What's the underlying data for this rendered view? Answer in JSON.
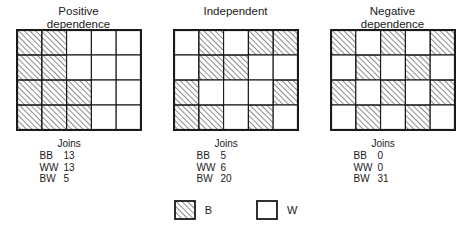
{
  "figure": {
    "panels": [
      {
        "id": "positive-dependence",
        "title": "Positive\ndependence",
        "grid": {
          "cols": 5,
          "rows": 4,
          "cells": [
            [
              "B",
              "B",
              "W",
              "W",
              "W"
            ],
            [
              "B",
              "B",
              "W",
              "W",
              "W"
            ],
            [
              "B",
              "B",
              "B",
              "W",
              "W"
            ],
            [
              "B",
              "B",
              "B",
              "W",
              "W"
            ]
          ]
        },
        "stats": {
          "heading": "Joins",
          "rows": [
            {
              "key": "BB",
              "value": "13"
            },
            {
              "key": "WW",
              "value": "13"
            },
            {
              "key": "BW",
              "value": "5"
            }
          ]
        }
      },
      {
        "id": "independent",
        "title": "Independent",
        "grid": {
          "cols": 5,
          "rows": 4,
          "cells": [
            [
              "W",
              "B",
              "W",
              "B",
              "B"
            ],
            [
              "W",
              "B",
              "B",
              "W",
              "W"
            ],
            [
              "B",
              "W",
              "W",
              "W",
              "B"
            ],
            [
              "B",
              "B",
              "W",
              "B",
              "W"
            ]
          ]
        },
        "stats": {
          "heading": "Joins",
          "rows": [
            {
              "key": "BB",
              "value": "5"
            },
            {
              "key": "WW",
              "value": "6"
            },
            {
              "key": "BW",
              "value": "20"
            }
          ]
        }
      },
      {
        "id": "negative-dependence",
        "title": "Negative\ndependence",
        "grid": {
          "cols": 5,
          "rows": 4,
          "cells": [
            [
              "B",
              "W",
              "B",
              "W",
              "B"
            ],
            [
              "W",
              "B",
              "W",
              "B",
              "W"
            ],
            [
              "B",
              "W",
              "B",
              "W",
              "B"
            ],
            [
              "W",
              "B",
              "W",
              "B",
              "W"
            ]
          ]
        },
        "stats": {
          "heading": "Joins",
          "rows": [
            {
              "key": "BB",
              "value": "0"
            },
            {
              "key": "WW",
              "value": "0"
            },
            {
              "key": "BW",
              "value": "31"
            }
          ]
        }
      }
    ],
    "legend": [
      {
        "fill": "B",
        "label": "B"
      },
      {
        "fill": "W",
        "label": "W"
      }
    ],
    "colors": {
      "line": "#1a1a1a",
      "hatch": "#2b2b2b",
      "background": "#ffffff"
    }
  }
}
